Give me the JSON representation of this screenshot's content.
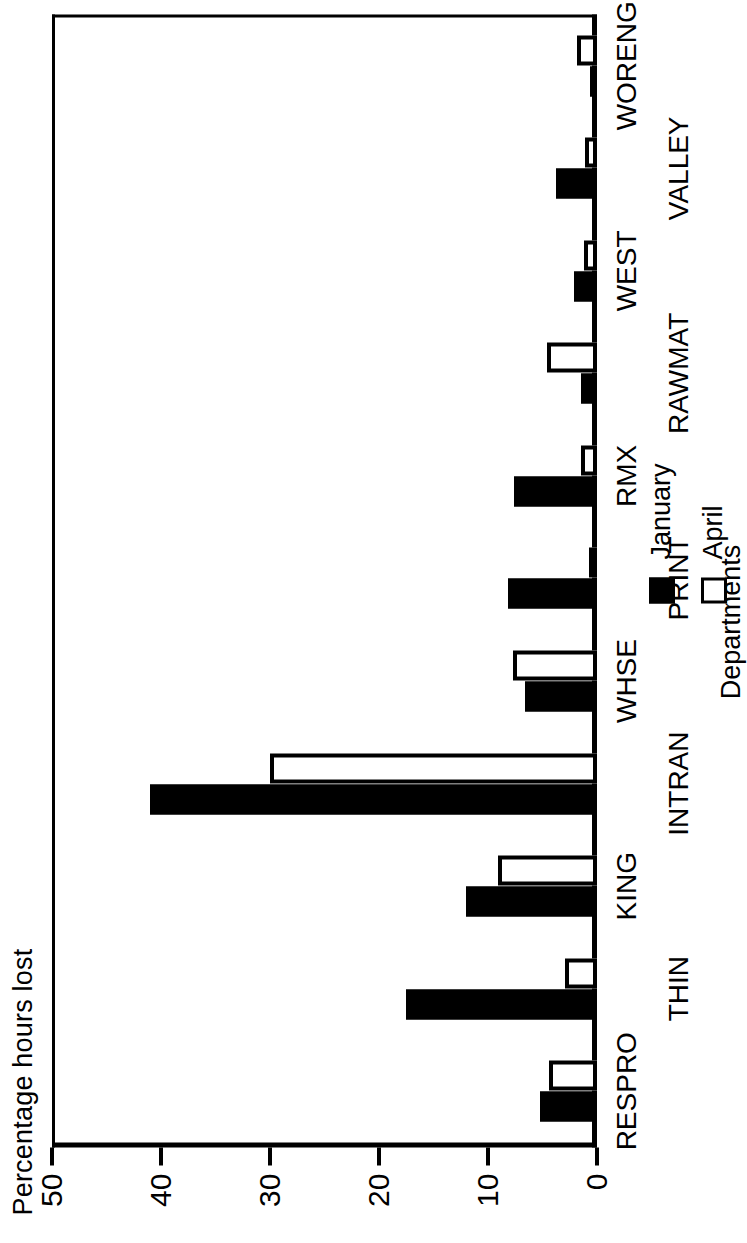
{
  "chart_data": {
    "type": "bar",
    "orientation": "vertical-rendered-rotated",
    "title": "",
    "xlabel": "Departments",
    "ylabel": "Percentage hours lost",
    "ylim": [
      0,
      50
    ],
    "yticks": [
      0,
      10,
      20,
      30,
      40,
      50
    ],
    "ytick_labels": [
      "0",
      "10",
      "20",
      "30",
      "40",
      "50"
    ],
    "grid": false,
    "legend_position": "below-axis-right",
    "categories": [
      "RESPRO",
      "THIN",
      "KING",
      "INTRAN",
      "WHSE",
      "PRINT",
      "RMX",
      "RAWMAT",
      "WEST",
      "VALLEY",
      "WORENG"
    ],
    "series": [
      {
        "name": "January",
        "color": "#000000",
        "fill": "solid",
        "values": [
          5.2,
          17.5,
          12.0,
          41.0,
          6.6,
          8.2,
          7.6,
          1.5,
          2.1,
          3.8,
          0.6
        ]
      },
      {
        "name": "April",
        "color": "#ffffff",
        "fill": "hollow",
        "values": [
          4.4,
          2.9,
          9.1,
          30.0,
          7.7,
          0.7,
          1.5,
          4.6,
          1.2,
          1.1,
          1.8
        ]
      }
    ]
  },
  "axes": {
    "y_title": "Percentage hours lost",
    "x_title": "Departments"
  },
  "legend": {
    "items": [
      {
        "label": "January",
        "swatch": "filled-black-square"
      },
      {
        "label": "April",
        "swatch": "hollow-square"
      }
    ]
  }
}
